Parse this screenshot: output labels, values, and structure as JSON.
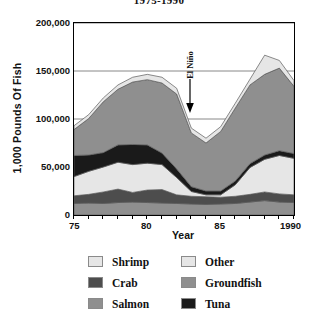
{
  "title": "1975-1990",
  "axes": {
    "ylabel": "1,000 Pounds Of Fish",
    "xlabel": "Year",
    "ytick_labels": [
      "0",
      "50,000",
      "100,000",
      "150,000",
      "200,000"
    ],
    "xtick_labels": [
      "75",
      "80",
      "85",
      "1990"
    ]
  },
  "annotation": {
    "text": "El Niño",
    "arrow": "down-arrow-icon"
  },
  "legend": {
    "rows": [
      [
        {
          "label": "Shrimp",
          "color": "#e6e6e6"
        },
        {
          "label": "Other",
          "color": "#e6e6e6"
        }
      ],
      [
        {
          "label": "Crab",
          "color": "#4d4d4d"
        },
        {
          "label": "Groundfish",
          "color": "#8f8f8f"
        }
      ],
      [
        {
          "label": "Salmon",
          "color": "#8f8f8f"
        },
        {
          "label": "Tuna",
          "color": "#1a1a1a"
        }
      ]
    ]
  },
  "chart_data": {
    "type": "area",
    "title": "1975-1990",
    "xlabel": "Year",
    "ylabel": "1,000 Pounds Of Fish",
    "xlim": [
      1975,
      1990
    ],
    "ylim": [
      0,
      200000
    ],
    "ytick_values": [
      0,
      50000,
      100000,
      150000,
      200000
    ],
    "xtick_values": [
      1975,
      1980,
      1985,
      1990
    ],
    "grid": "horizontal",
    "legend_position": "below",
    "stacked": true,
    "stack_order_bottom_to_top": [
      "Salmon",
      "Crab",
      "Shrimp",
      "Tuna",
      "Groundfish",
      "Other"
    ],
    "x": [
      1975,
      1976,
      1977,
      1978,
      1979,
      1980,
      1981,
      1982,
      1983,
      1984,
      1985,
      1986,
      1987,
      1988,
      1989,
      1990
    ],
    "series": [
      {
        "name": "Salmon",
        "color": "#8f8f8f",
        "values": [
          12000,
          12500,
          12000,
          13000,
          13500,
          13000,
          12500,
          12000,
          11500,
          11000,
          11500,
          12000,
          13500,
          15000,
          13500,
          13000
        ]
      },
      {
        "name": "Crab",
        "color": "#4d4d4d",
        "values": [
          8000,
          9000,
          12000,
          14000,
          10000,
          13000,
          14000,
          9000,
          8000,
          8000,
          7000,
          7500,
          8000,
          9000,
          8500,
          8000
        ]
      },
      {
        "name": "Shrimp",
        "color": "#e6e6e6",
        "values": [
          20000,
          24000,
          26000,
          28000,
          29000,
          28000,
          26000,
          18000,
          5000,
          2000,
          2500,
          12000,
          28000,
          34000,
          40000,
          38000
        ]
      },
      {
        "name": "Tuna",
        "color": "#1a1a1a",
        "values": [
          22000,
          17000,
          15000,
          18000,
          21000,
          19000,
          12000,
          9000,
          5000,
          4000,
          4000,
          4000,
          4000,
          4500,
          5000,
          5000
        ]
      },
      {
        "name": "Groundfish",
        "color": "#8f8f8f",
        "values": [
          27000,
          38000,
          53000,
          58000,
          65000,
          68000,
          73000,
          78000,
          56000,
          50000,
          62000,
          76000,
          82000,
          84000,
          86000,
          70000
        ]
      },
      {
        "name": "Other",
        "color": "#e6e6e6",
        "values": [
          4000,
          4000,
          4000,
          4500,
          5000,
          5500,
          6000,
          6000,
          5000,
          5000,
          5000,
          5000,
          6000,
          20000,
          8000,
          6000
        ]
      }
    ],
    "annotations": [
      {
        "text": "El Niño",
        "x": 1983,
        "y": 150000,
        "marker": "downward arrow pointing to 1983 minimum"
      }
    ]
  }
}
